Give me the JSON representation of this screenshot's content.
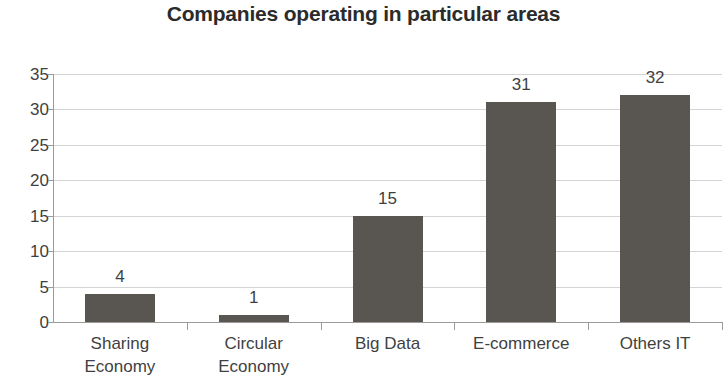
{
  "chart_data": {
    "type": "bar",
    "title": "Companies operating in particular areas",
    "xlabel": "",
    "ylabel": "",
    "categories": [
      "Sharing Economy",
      "Circular Economy",
      "Big Data",
      "E-commerce",
      "Others IT"
    ],
    "category_lines": [
      [
        "Sharing",
        "Economy"
      ],
      [
        "Circular",
        "Economy"
      ],
      [
        "Big Data"
      ],
      [
        "E-commerce"
      ],
      [
        "Others IT"
      ]
    ],
    "values": [
      4,
      1,
      15,
      31,
      32
    ],
    "data_labels": [
      "4",
      "1",
      "15",
      "31",
      "32"
    ],
    "ylim": [
      0,
      35
    ],
    "ytick_values": [
      35,
      30,
      25,
      20,
      15,
      10,
      5,
      0
    ],
    "ytick_labels": [
      "35",
      "30",
      "25",
      "20",
      "15",
      "10",
      "5",
      "0"
    ],
    "grid": true,
    "legend": false,
    "legend_position": "none",
    "bar_color": "#595550",
    "gridline_color": "#d4d4d4",
    "axis_color": "#9a9a9a",
    "text_color": "#3f3f3f",
    "background_color": "#ffffff"
  }
}
